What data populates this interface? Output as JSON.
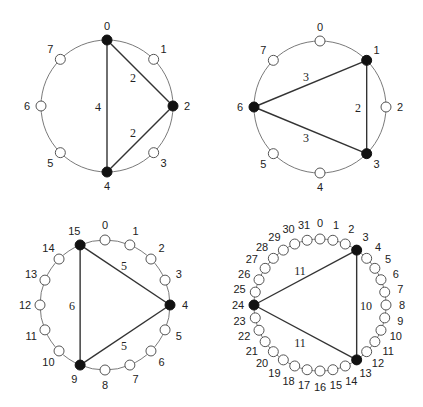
{
  "diagrams": [
    {
      "id": "ring-8-a",
      "n": 8,
      "center": [
        107,
        106
      ],
      "radius": 66,
      "node_radius": 5,
      "label_offset": 14,
      "label_font_size": 11,
      "filled_nodes": [
        0,
        2,
        4
      ],
      "edges": [
        {
          "from": 0,
          "to": 2,
          "label": "2",
          "label_pos": [
            133,
            82
          ]
        },
        {
          "from": 2,
          "to": 4,
          "label": "2",
          "label_pos": [
            133,
            137
          ]
        },
        {
          "from": 0,
          "to": 4,
          "label": "4",
          "label_pos": [
            98,
            111
          ]
        }
      ]
    },
    {
      "id": "ring-8-b",
      "n": 8,
      "center": [
        320,
        107
      ],
      "radius": 66,
      "node_radius": 5,
      "label_offset": 14,
      "label_font_size": 11,
      "filled_nodes": [
        1,
        3,
        6
      ],
      "edges": [
        {
          "from": 1,
          "to": 6,
          "label": "3",
          "label_pos": [
            306,
            81
          ]
        },
        {
          "from": 1,
          "to": 3,
          "label": "2",
          "label_pos": [
            358,
            112
          ]
        },
        {
          "from": 6,
          "to": 3,
          "label": "3",
          "label_pos": [
            306,
            142
          ]
        }
      ]
    },
    {
      "id": "ring-16",
      "n": 16,
      "center": [
        105,
        305
      ],
      "radius": 65,
      "node_radius": 5,
      "label_offset": 15,
      "label_font_size": 11,
      "filled_nodes": [
        4,
        9,
        15
      ],
      "edges": [
        {
          "from": 15,
          "to": 4,
          "label": "5",
          "label_pos": [
            124,
            270
          ]
        },
        {
          "from": 4,
          "to": 9,
          "label": "5",
          "label_pos": [
            124,
            350
          ]
        },
        {
          "from": 15,
          "to": 9,
          "label": "6",
          "label_pos": [
            72,
            310
          ]
        }
      ]
    },
    {
      "id": "ring-32",
      "n": 32,
      "center": [
        320,
        305
      ],
      "radius": 66,
      "node_radius": 5,
      "label_offset": 16,
      "label_font_size": 10,
      "filled_nodes": [
        3,
        13,
        24
      ],
      "edges": [
        {
          "from": 3,
          "to": 24,
          "label": "11",
          "label_pos": [
            300,
            275
          ]
        },
        {
          "from": 3,
          "to": 13,
          "label": "10",
          "label_pos": [
            366,
            310
          ]
        },
        {
          "from": 24,
          "to": 13,
          "label": "11",
          "label_pos": [
            300,
            347
          ]
        }
      ]
    }
  ]
}
